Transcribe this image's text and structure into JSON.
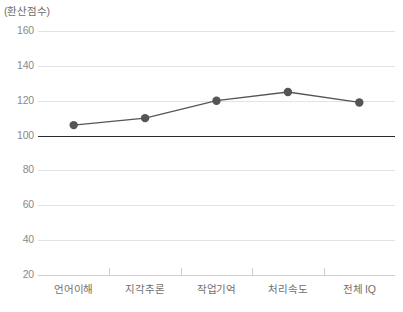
{
  "chart_data": {
    "type": "line",
    "title": "",
    "subtitle": "",
    "xlabel": "",
    "ylabel": "(환산점수)",
    "categories": [
      "언어이해",
      "지각추론",
      "작업기억",
      "처리속도",
      "전체 IQ"
    ],
    "values": [
      106,
      110,
      120,
      125,
      119
    ],
    "series": [
      {
        "name": "환산점수",
        "values": [
          106,
          110,
          120,
          125,
          119
        ]
      }
    ],
    "ylim": [
      20,
      160
    ],
    "ytick_values": [
      160,
      140,
      120,
      100,
      80,
      60,
      40,
      20
    ],
    "ytick_labels": [
      "160",
      "140",
      "120",
      "100",
      "80",
      "60",
      "40",
      "20"
    ],
    "grid": true,
    "legend": false,
    "legend_position": "none",
    "reference_line": {
      "value": 100,
      "label": "100",
      "emphasis": "bold"
    },
    "colors": {
      "series_line": "#555555",
      "series_marker": "#555555",
      "gridline": "#e3e3e3",
      "reference_line": "#2b2b2b",
      "axis_line": "#cfcfcf",
      "tick_label": "#8a8a8a",
      "category_label": "#6f6f6f",
      "axis_title": "#6e6e6e",
      "background": "#ffffff"
    }
  }
}
